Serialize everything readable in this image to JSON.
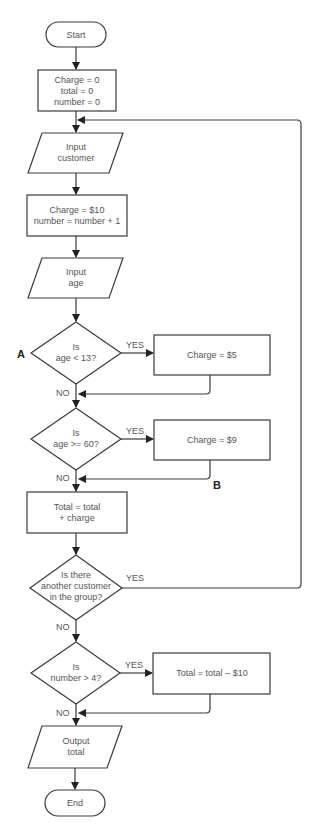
{
  "flowchart": {
    "start": "Start",
    "init": [
      "Charge = 0",
      "total = 0",
      "number = 0"
    ],
    "input_customer": [
      "Input",
      "customer"
    ],
    "set_charge": [
      "Charge = $10",
      "number = number + 1"
    ],
    "input_age": [
      "Input",
      "age"
    ],
    "decision_child": [
      "Is",
      "age < 13?"
    ],
    "child_charge": "Charge = $5",
    "decision_senior": [
      "Is",
      "age >= 60?"
    ],
    "senior_charge": "Charge = $9",
    "add_total": [
      "Total = total",
      "+ charge"
    ],
    "decision_more": [
      "Is there",
      "another customer",
      "in the group?"
    ],
    "decision_group": [
      "Is",
      "number > 4?"
    ],
    "discount": "Total = total – $10",
    "output_total": [
      "Output",
      "total"
    ],
    "end": "End",
    "yes_label": "YES",
    "no_label": "NO",
    "marker_a": "A",
    "marker_b": "B"
  }
}
